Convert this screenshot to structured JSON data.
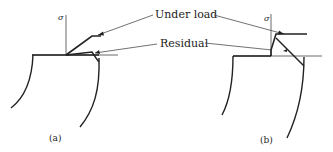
{
  "figure": {
    "labels": {
      "under_load": "Under load",
      "residual": "Residual",
      "sigma": "σ"
    },
    "panels": [
      {
        "id": "a",
        "caption": "(a)",
        "sigma": "σ"
      },
      {
        "id": "b",
        "caption": "(b)",
        "sigma": "σ"
      }
    ],
    "colors": {
      "line": "#222222",
      "background": "#ffffff"
    }
  }
}
